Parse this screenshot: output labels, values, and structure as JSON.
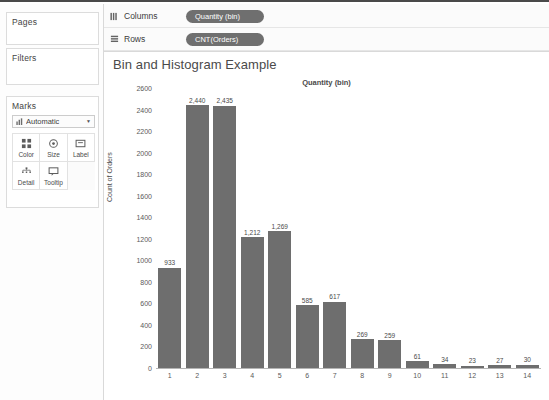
{
  "window": {
    "left_panel": {
      "pages_card": {
        "title": "Pages"
      },
      "filters_card": {
        "title": "Filters"
      },
      "marks_card": {
        "title": "Marks",
        "mark_type_value": "Automatic",
        "mark_type_icon": "bar-chart-icon",
        "caret_icon": "chevron-down-icon",
        "buttons": [
          {
            "label": "Color",
            "icon": "color-palette-icon"
          },
          {
            "label": "Size",
            "icon": "size-circle-icon"
          },
          {
            "label": "Label",
            "icon": "label-tag-icon"
          },
          {
            "label": "Detail",
            "icon": "detail-dots-icon"
          },
          {
            "label": "Tooltip",
            "icon": "tooltip-bubble-icon"
          }
        ]
      }
    },
    "shelves": [
      {
        "name": "Columns",
        "icon": "columns-grid-icon",
        "pill": "Quantity (bin)"
      },
      {
        "name": "Rows",
        "icon": "rows-grid-icon",
        "pill": "CNT(Orders)"
      }
    ]
  },
  "chart_data": {
    "type": "bar",
    "title": "Bin and Histogram Example",
    "column_header": "Quantity (bin)",
    "xlabel": "",
    "ylabel": "Count of Orders",
    "categories": [
      "1",
      "2",
      "3",
      "4",
      "5",
      "6",
      "7",
      "8",
      "9",
      "10",
      "11",
      "12",
      "13",
      "14"
    ],
    "values": [
      933,
      2440,
      2435,
      1212,
      1269,
      585,
      617,
      269,
      259,
      61,
      34,
      23,
      27,
      30
    ],
    "value_labels": [
      "933",
      "2,440",
      "2,435",
      "1,212",
      "1,269",
      "585",
      "617",
      "269",
      "259",
      "61",
      "34",
      "23",
      "27",
      "30"
    ],
    "ylim": [
      0,
      2600
    ],
    "yticks": [
      0,
      200,
      400,
      600,
      800,
      1000,
      1200,
      1400,
      1600,
      1800,
      2000,
      2200,
      2400,
      2600
    ],
    "ytick_labels": [
      "0",
      "200",
      "400",
      "600",
      "800",
      "1000",
      "1200",
      "1400",
      "1600",
      "1800",
      "2000",
      "2200",
      "2400",
      "2600"
    ],
    "grid": false,
    "legend": "none",
    "bar_color": "#6e6e6e"
  },
  "caption": ""
}
